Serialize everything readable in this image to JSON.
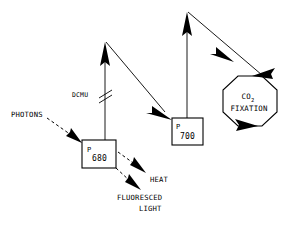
{
  "diagram": {
    "background_color": "#ffffff",
    "ink_color": "#000000",
    "nodes": {
      "photosystem_ii": {
        "label_main": "P",
        "label_sub": "680",
        "name": "P680 reaction center"
      },
      "photosystem_i": {
        "label_main": "P",
        "label_sub": "700",
        "name": "P700 reaction center"
      },
      "carbon_fixation": {
        "line1_main": "CO",
        "line1_sub": "2",
        "line2": "FIXATION",
        "shape": "octagon"
      }
    },
    "labels": {
      "photons": "PHOTONS",
      "inhibitor": "DCMU",
      "heat": "HEAT",
      "fluoresced_line1": "FLUORESCED",
      "fluoresced_line2": "LIGHT"
    },
    "arrows": {
      "photons_to_p680": "dashed",
      "p680_excitation_up": "solid",
      "p680_to_p700": "solid",
      "p680_to_heat": "dashed",
      "p680_to_fluoresced_light": "dashed",
      "p700_excitation_up": "solid",
      "p700_to_co2_fixation": "solid",
      "co2_fixation_output": "solid"
    },
    "inhibition_mark": {
      "symbol": "double-slash",
      "blocks": "p680_excitation_up"
    }
  }
}
